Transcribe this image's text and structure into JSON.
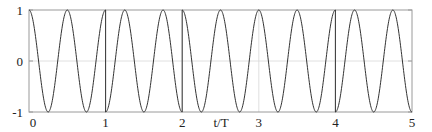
{
  "chart_data": {
    "type": "line",
    "title": "",
    "xlabel": "t/T",
    "ylabel": "",
    "xlim": [
      0,
      5
    ],
    "ylim": [
      -1,
      1
    ],
    "x_ticks": [
      "0",
      "1",
      "2",
      "3",
      "4",
      "5"
    ],
    "y_ticks": [
      "-1",
      "0",
      "1"
    ],
    "grid": true,
    "legend": null,
    "carrier_cycles_per_T": 2,
    "symbols": [
      {
        "t_start": 0,
        "t_end": 1,
        "sign": 1
      },
      {
        "t_start": 1,
        "t_end": 2,
        "sign": -1
      },
      {
        "t_start": 2,
        "t_end": 3,
        "sign": 1
      },
      {
        "t_start": 3,
        "t_end": 4,
        "sign": 1
      },
      {
        "t_start": 4,
        "t_end": 5,
        "sign": -1
      }
    ],
    "series": [
      {
        "name": "s(t)",
        "formula": "sign_k * cos(4*pi*t/T)",
        "color": "#333333"
      }
    ]
  },
  "colors": {
    "wave": "#333333",
    "frame": "#9a9a9a",
    "grid": "#d8d8d8",
    "text": "#222222"
  }
}
